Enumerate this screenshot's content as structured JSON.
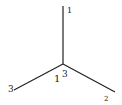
{
  "diagram": {
    "type": "three-bond-junction",
    "center": {
      "x": 63,
      "y": 64
    },
    "arms": [
      {
        "name": "top",
        "end": {
          "x": 63,
          "y": 6
        },
        "label": "1"
      },
      {
        "name": "lower-left",
        "end": {
          "x": 14,
          "y": 90
        },
        "label": "3"
      },
      {
        "name": "lower-right",
        "end": {
          "x": 115,
          "y": 92
        },
        "label": "2"
      }
    ],
    "center_labels": [
      {
        "text": "1",
        "x": 54,
        "y": 82
      },
      {
        "text": "3",
        "x": 62,
        "y": 77
      }
    ],
    "line_color": "#222222"
  }
}
